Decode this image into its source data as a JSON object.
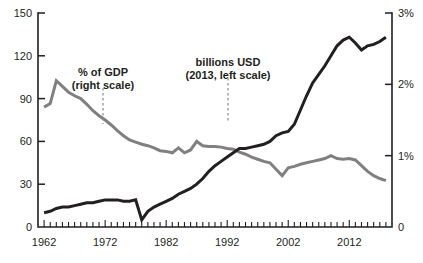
{
  "chart_data": {
    "type": "line",
    "title": "",
    "subtitle": "",
    "xlabel": "",
    "ylabel": "",
    "grid": false,
    "legend_position": "inline-annotations",
    "x": [
      1962,
      1963,
      1964,
      1965,
      1966,
      1967,
      1968,
      1969,
      1970,
      1971,
      1972,
      1973,
      1974,
      1975,
      1976,
      1977,
      1978,
      1979,
      1980,
      1981,
      1982,
      1983,
      1984,
      1985,
      1986,
      1987,
      1988,
      1989,
      1990,
      1991,
      1992,
      1993,
      1994,
      1995,
      1996,
      1997,
      1998,
      1999,
      2000,
      2001,
      2002,
      2003,
      2004,
      2005,
      2006,
      2007,
      2008,
      2009,
      2010,
      2011,
      2012,
      2013,
      2014,
      2015,
      2016,
      2017,
      2018
    ],
    "x_ticks": [
      1962,
      1972,
      1982,
      1992,
      2002,
      2012
    ],
    "x_tick_labels": [
      "1962",
      "1972",
      "1982",
      "1992",
      "2002",
      "2012"
    ],
    "xlim": [
      1961,
      2019
    ],
    "left_axis": {
      "label": "billions USD (2013, left scale)",
      "ticks": [
        0,
        30,
        60,
        90,
        120,
        150
      ],
      "tick_labels": [
        "0",
        "30",
        "60",
        "90",
        "120",
        "150"
      ],
      "ylim": [
        0,
        150
      ],
      "color": "#231f20"
    },
    "right_axis": {
      "label": "% of GDP (right scale)",
      "ticks": [
        0,
        1,
        2,
        3
      ],
      "tick_labels": [
        "0",
        "1%",
        "2%",
        "3%"
      ],
      "ylim": [
        0,
        3
      ],
      "color": "#808080"
    },
    "series": [
      {
        "name": "billions USD (2013, left scale)",
        "axis": "left",
        "color": "#231f20",
        "stroke_width": 3.0,
        "values": [
          10,
          11,
          13,
          14,
          14,
          15,
          16,
          17,
          17,
          18,
          19,
          19,
          19,
          18,
          18,
          19,
          5,
          11,
          14,
          16,
          18,
          20,
          23,
          25,
          27,
          30,
          34,
          39,
          43,
          46,
          49,
          52,
          55,
          55,
          56,
          57,
          58,
          60,
          64,
          66,
          67,
          72,
          82,
          92,
          101,
          107,
          113,
          120,
          127,
          131,
          133,
          129,
          124,
          127,
          128,
          130,
          133
        ]
      },
      {
        "name": "% of GDP (right scale)",
        "axis": "right",
        "color": "#808080",
        "stroke_width": 3.0,
        "values": [
          1.68,
          1.73,
          2.05,
          1.97,
          1.89,
          1.84,
          1.8,
          1.72,
          1.63,
          1.56,
          1.5,
          1.43,
          1.35,
          1.28,
          1.22,
          1.19,
          1.16,
          1.14,
          1.11,
          1.07,
          1.06,
          1.04,
          1.11,
          1.04,
          1.08,
          1.2,
          1.14,
          1.13,
          1.13,
          1.12,
          1.1,
          1.09,
          1.05,
          1.02,
          0.98,
          0.95,
          0.92,
          0.9,
          0.81,
          0.72,
          0.83,
          0.85,
          0.88,
          0.9,
          0.92,
          0.94,
          0.96,
          1.0,
          0.96,
          0.95,
          0.96,
          0.94,
          0.86,
          0.78,
          0.72,
          0.68,
          0.65
        ]
      }
    ],
    "annotations": [
      {
        "id": "gdp-annotation",
        "line1": "% of GDP",
        "line2": "(right scale)",
        "text_x": 103,
        "text_y": 76,
        "leader_x": 103,
        "leader_y_start": 88,
        "leader_y_end": 124
      },
      {
        "id": "usd-annotation",
        "line1": "billions USD",
        "line2": "(2013, left scale)",
        "text_x": 228,
        "text_y": 66,
        "leader_x": 228,
        "leader_y_start": 78,
        "leader_y_end": 123
      }
    ],
    "geometry": {
      "plot_left": 38,
      "plot_right": 392,
      "plot_top": 13,
      "plot_bottom": 227
    }
  }
}
